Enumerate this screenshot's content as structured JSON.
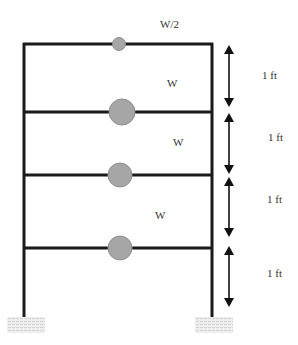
{
  "diagram": {
    "colors": {
      "frame": "#1a1a1a",
      "mass_fill": "#a6a6a6",
      "mass_stroke": "#8a8a8a",
      "arrow": "#111111",
      "ground": "#d9d9d9",
      "text": "#333333"
    },
    "frame": {
      "left_column_x": 24,
      "right_column_x": 212,
      "top_y": 44,
      "base_y": 316
    },
    "floors": [
      {
        "id": "roof",
        "y": 44,
        "mass_label": "W/2",
        "mass_radius": 6.5,
        "mass_x": 119,
        "label_x": 160,
        "label_y": 19
      },
      {
        "id": "floor-3",
        "y": 112,
        "mass_label": "W",
        "mass_radius": 13,
        "mass_x": 122,
        "label_x": 167,
        "label_y": 78
      },
      {
        "id": "floor-2",
        "y": 175,
        "mass_label": "W",
        "mass_radius": 12,
        "mass_x": 120,
        "label_x": 173,
        "label_y": 137
      },
      {
        "id": "floor-1",
        "y": 248,
        "mass_label": "W",
        "mass_radius": 12,
        "mass_x": 120,
        "label_x": 155,
        "label_y": 210
      }
    ],
    "dimensions": [
      {
        "label": "1 ft",
        "top_y": 45,
        "bottom_y": 107,
        "label_y": 70
      },
      {
        "label": "1 ft",
        "top_y": 113,
        "bottom_y": 174,
        "label_y": 132
      },
      {
        "label": "1 ft",
        "top_y": 177,
        "bottom_y": 237,
        "label_y": 194
      },
      {
        "label": "1 ft",
        "top_y": 246,
        "bottom_y": 307,
        "label_y": 268
      }
    ],
    "dimension_arrow_x": 229,
    "dimension_label_x": 262,
    "supports": [
      {
        "id": "left-support",
        "x": 7,
        "y": 317,
        "width": 38,
        "height": 16
      },
      {
        "id": "right-support",
        "x": 195,
        "y": 317,
        "width": 38,
        "height": 16
      }
    ]
  },
  "labels": {
    "roof_mass": "W/2",
    "floor3_mass": "W",
    "floor2_mass": "W",
    "floor1_mass": "W",
    "story4_height": "1 ft",
    "story3_height": "1 ft",
    "story2_height": "1 ft",
    "story1_height": "1 ft"
  }
}
